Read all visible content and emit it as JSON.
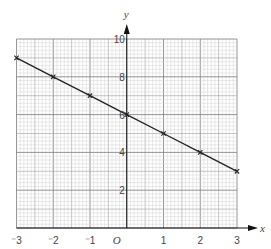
{
  "chart_data": {
    "type": "line",
    "title": "",
    "xlabel": "x",
    "ylabel": "y",
    "origin_label": "O",
    "xlim": [
      -3,
      3
    ],
    "ylim": [
      0,
      10
    ],
    "grid": true,
    "legend": null,
    "x_ticks": [
      -3,
      -2,
      -1,
      0,
      1,
      2,
      3
    ],
    "x_tick_labels": [
      "⁻3",
      "⁻2",
      "⁻1",
      "O",
      "1",
      "2",
      "3"
    ],
    "y_ticks": [
      2,
      4,
      6,
      8,
      10
    ],
    "y_tick_labels": [
      "2",
      "4",
      "6",
      "8",
      "10"
    ],
    "series": [
      {
        "name": "line",
        "marker": "x",
        "x": [
          -3,
          -2,
          -1,
          0,
          1,
          2,
          3
        ],
        "y": [
          9,
          8,
          7,
          6,
          5,
          4,
          3
        ]
      }
    ]
  },
  "colors": {
    "line": "#222222",
    "axis": "#111111",
    "grid_minor": "#d2d2d2",
    "grid_mid": "#aaaaaa",
    "grid_major": "#888888",
    "label": "#444444"
  }
}
